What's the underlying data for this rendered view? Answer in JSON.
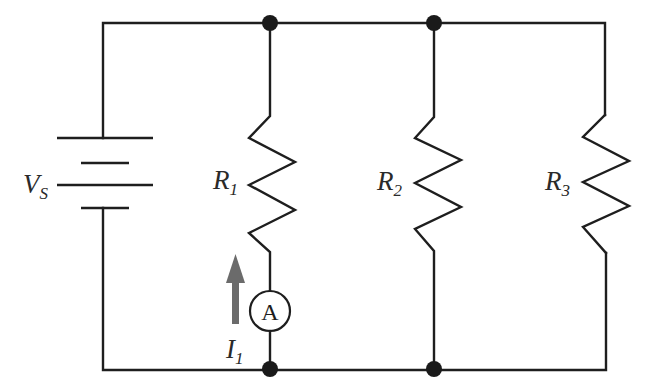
{
  "diagram": {
    "type": "parallel resistor circuit",
    "source": {
      "label": "V",
      "subscript": "S"
    },
    "resistors": [
      {
        "label": "R",
        "subscript": "1"
      },
      {
        "label": "R",
        "subscript": "2"
      },
      {
        "label": "R",
        "subscript": "3"
      }
    ],
    "ammeter": {
      "symbol": "A",
      "branch": "R1"
    },
    "current": {
      "label": "I",
      "subscript": "1",
      "direction": "up"
    },
    "colors": {
      "wire": "#1e1e1e",
      "arrow": "#6b6b6b",
      "background": "#ffffff"
    }
  }
}
